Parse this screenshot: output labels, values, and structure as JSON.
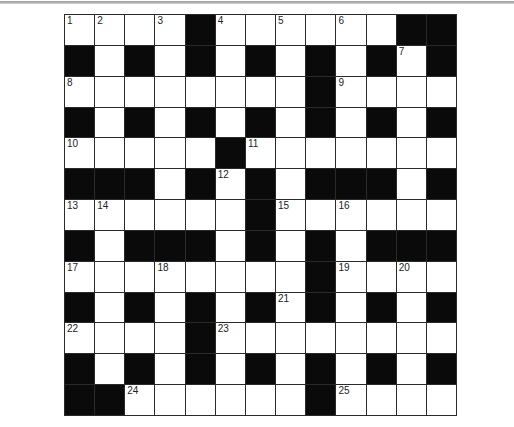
{
  "puzzle": {
    "title": "",
    "rows": 13,
    "cols": 13,
    "colors": {
      "block": "#0a0a0a",
      "empty": "#ffffff",
      "rule": "#2a2a2a"
    },
    "grid": [
      "....#......##",
      "#.#.#.#.#.#.#",
      "........#....",
      "#.#.#.#.#.#.#",
      ".....#.......",
      "###.#.#.###.#",
      "......#......",
      "#.###.#.#.###",
      "........#....",
      "#.#.#.#.#.#.#",
      "....#........",
      "#.#.#.#.#.#.#",
      "##......#...."
    ],
    "numbers": [
      {
        "r": 0,
        "c": 0,
        "n": "1"
      },
      {
        "r": 0,
        "c": 1,
        "n": "2"
      },
      {
        "r": 0,
        "c": 3,
        "n": "3"
      },
      {
        "r": 0,
        "c": 5,
        "n": "4"
      },
      {
        "r": 0,
        "c": 7,
        "n": "5"
      },
      {
        "r": 0,
        "c": 9,
        "n": "6"
      },
      {
        "r": 1,
        "c": 11,
        "n": "7"
      },
      {
        "r": 2,
        "c": 0,
        "n": "8"
      },
      {
        "r": 2,
        "c": 9,
        "n": "9"
      },
      {
        "r": 4,
        "c": 0,
        "n": "10"
      },
      {
        "r": 4,
        "c": 6,
        "n": "11"
      },
      {
        "r": 5,
        "c": 5,
        "n": "12"
      },
      {
        "r": 6,
        "c": 0,
        "n": "13"
      },
      {
        "r": 6,
        "c": 1,
        "n": "14"
      },
      {
        "r": 6,
        "c": 7,
        "n": "15"
      },
      {
        "r": 6,
        "c": 9,
        "n": "16"
      },
      {
        "r": 8,
        "c": 0,
        "n": "17"
      },
      {
        "r": 8,
        "c": 3,
        "n": "18"
      },
      {
        "r": 8,
        "c": 9,
        "n": "19"
      },
      {
        "r": 8,
        "c": 11,
        "n": "20"
      },
      {
        "r": 9,
        "c": 7,
        "n": "21"
      },
      {
        "r": 10,
        "c": 0,
        "n": "22"
      },
      {
        "r": 10,
        "c": 5,
        "n": "23"
      },
      {
        "r": 12,
        "c": 2,
        "n": "24"
      },
      {
        "r": 12,
        "c": 9,
        "n": "25"
      }
    ]
  }
}
